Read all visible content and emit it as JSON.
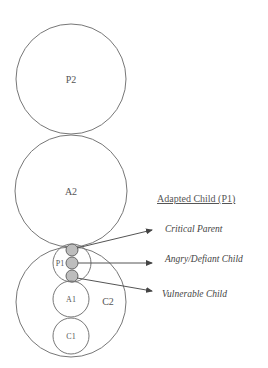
{
  "diagram": {
    "circles": {
      "p2": {
        "label": "P2"
      },
      "a2": {
        "label": "A2"
      },
      "c2": {
        "label": "C2"
      },
      "p1": {
        "label": "P1"
      },
      "a1": {
        "label": "A1"
      },
      "c1": {
        "label": "C1"
      }
    },
    "legend": {
      "title": "Adapted Child (P1)",
      "items": [
        {
          "label": "Critical Parent"
        },
        {
          "label": "Angry/Defiant Child"
        },
        {
          "label": "Vulnerable Child"
        }
      ]
    },
    "colors": {
      "stroke": "#777777",
      "sub_fill": "#bdbdbd",
      "text": "#555555"
    }
  }
}
